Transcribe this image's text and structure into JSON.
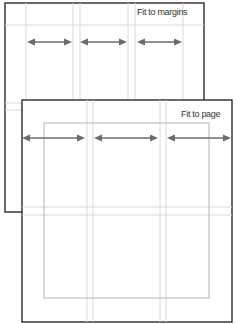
{
  "diagram": {
    "colors": {
      "frame": "#2b2b2b",
      "guide": "#d9d9d9",
      "margin": "#b4b4b4",
      "arrow": "#6b6b6b",
      "background": "#ffffff"
    },
    "panels": [
      {
        "id": "fit-to-margins",
        "label": "Fit to margins",
        "frame": {
          "x": 5,
          "y": 3,
          "w": 199,
          "h": 209
        },
        "columns": 3,
        "arrows": [
          {
            "x1": 27,
            "x2": 72,
            "y": 42
          },
          {
            "x1": 80,
            "x2": 127,
            "y": 42
          },
          {
            "x1": 137,
            "x2": 182,
            "y": 42
          }
        ]
      },
      {
        "id": "fit-to-page",
        "label": "Fit to page",
        "frame": {
          "x": 22,
          "y": 100,
          "w": 210,
          "h": 222
        },
        "margin_box": {
          "x": 44,
          "y": 123,
          "w": 165,
          "h": 175
        },
        "columns": 3,
        "arrows": [
          {
            "x1": 22,
            "x2": 85,
            "y": 138
          },
          {
            "x1": 94,
            "x2": 158,
            "y": 138
          },
          {
            "x1": 167,
            "x2": 231,
            "y": 138
          }
        ]
      }
    ]
  }
}
